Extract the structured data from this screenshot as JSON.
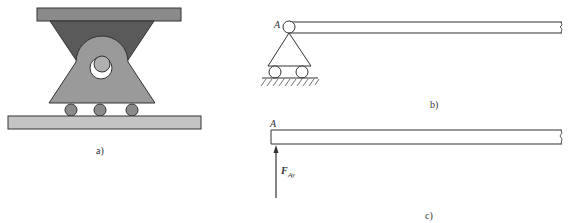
{
  "figure": {
    "panel_a": {
      "label": "a)",
      "colors": {
        "top_plate": "#8a8a8a",
        "upper_wedge": "#5a5a5a",
        "lower_body": "#9a9a9a",
        "pin": "#b0b0b0",
        "rollers": "#8a8a8a",
        "base_plate": "#c4c4c4"
      }
    },
    "panel_b": {
      "label": "b)",
      "point_label": "A"
    },
    "panel_c": {
      "label": "c)",
      "point_label": "A",
      "force_label": "F",
      "force_subscript": "Ay"
    }
  }
}
